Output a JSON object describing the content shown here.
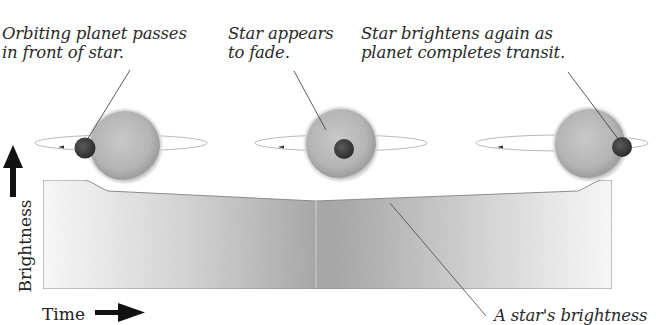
{
  "diagram": {
    "title_partial": "",
    "captions": {
      "stage1": [
        "Orbiting planet passes",
        "in front of star."
      ],
      "stage2": [
        "Star appears",
        "to fade."
      ],
      "stage3": [
        "Star brightens again as",
        "planet completes transit."
      ],
      "curve": [
        "A star's brightness"
      ]
    },
    "axes": {
      "y_label": "Brightness",
      "x_label": "Time"
    },
    "stages": [
      {
        "name": "ingress",
        "planet_position": "left edge of star"
      },
      {
        "name": "mid-transit",
        "planet_position": "center of star"
      },
      {
        "name": "egress",
        "planet_position": "right edge of star"
      }
    ],
    "light_curve": {
      "description": "Brightness stays high, drops as planet enters, dips gradually to a minimum at mid-transit, then rises back",
      "points_relative": [
        [
          0,
          1.0
        ],
        [
          0.1,
          1.0
        ],
        [
          0.16,
          0.92
        ],
        [
          0.5,
          0.84
        ],
        [
          0.84,
          0.92
        ],
        [
          0.9,
          1.0
        ],
        [
          1.0,
          1.0
        ]
      ]
    },
    "colors": {
      "star": "#b5b5b5",
      "planet": "#3a3a3a",
      "curve_fill_dark": "#a8a8a8",
      "curve_fill_light": "#f5f5f5",
      "outline": "#8a8a8a",
      "text": "#2a2a2a"
    }
  }
}
